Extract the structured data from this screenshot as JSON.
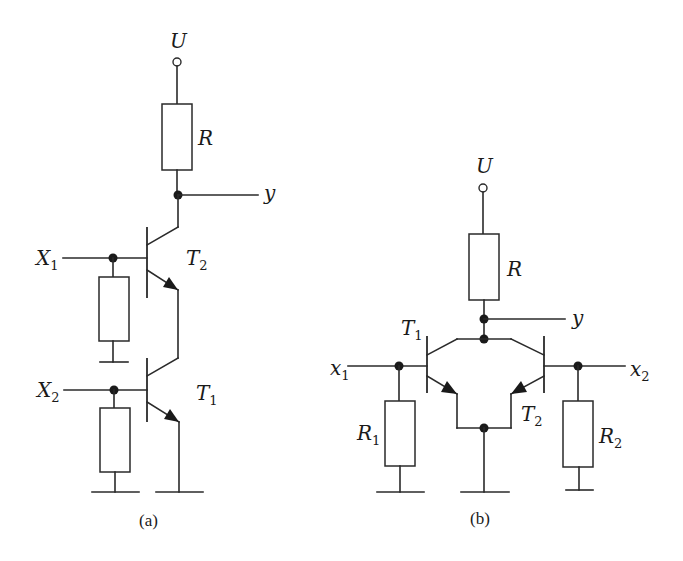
{
  "figure": {
    "panel_a": {
      "caption": "(a)",
      "supply_label": "U",
      "resistor_label": "R",
      "output_label": "y",
      "inputs": [
        {
          "name": "X",
          "sub": "1"
        },
        {
          "name": "X",
          "sub": "2"
        }
      ],
      "transistors": [
        {
          "name": "T",
          "sub": "2"
        },
        {
          "name": "T",
          "sub": "1"
        }
      ]
    },
    "panel_b": {
      "caption": "(b)",
      "supply_label": "U",
      "resistor_label": "R",
      "output_label": "y",
      "inputs": [
        {
          "name": "x",
          "sub": "1"
        },
        {
          "name": "x",
          "sub": "2"
        }
      ],
      "transistors": [
        {
          "name": "T",
          "sub": "1"
        },
        {
          "name": "T",
          "sub": "2"
        }
      ],
      "input_resistors": [
        {
          "name": "R",
          "sub": "1"
        },
        {
          "name": "R",
          "sub": "2"
        }
      ]
    }
  }
}
